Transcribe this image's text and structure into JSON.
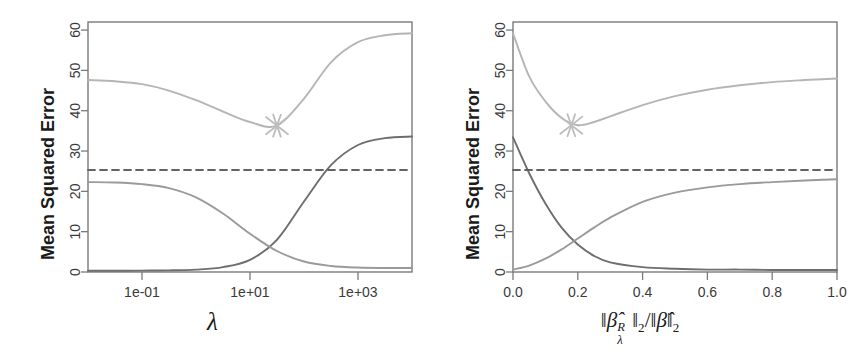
{
  "figure": {
    "title": "",
    "background_color": "#ffffff",
    "panel_count": 2
  },
  "panels": [
    {
      "id": "left",
      "ylabel": "Mean Squared Error",
      "xlabel": "λ",
      "xlabel_kind": "lambda",
      "x_ticks": [
        "1e-01",
        "1e+01",
        "1e+03"
      ],
      "y_ticks": [
        "0",
        "10",
        "20",
        "30",
        "40",
        "50",
        "60"
      ]
    },
    {
      "id": "right",
      "ylabel": "Mean Squared Error",
      "xlabel": "‖β̂ᴿλ‖₂/‖β̂‖₂",
      "xlabel_kind": "norm-ratio",
      "xlabel_parts": {
        "open1": "‖",
        "beta1": "β̂",
        "sup1": "R",
        "sub1": "λ",
        "close1": "‖",
        "sub_close1": "2",
        "slash": "/",
        "open2": "‖",
        "beta2": "β̂",
        "close2": "‖",
        "sub_close2": "2"
      },
      "x_ticks": [
        "0.0",
        "0.2",
        "0.4",
        "0.6",
        "0.8",
        "1.0"
      ],
      "y_ticks": [
        "0",
        "10",
        "20",
        "30",
        "40",
        "50",
        "60"
      ]
    }
  ],
  "colors": {
    "squared_bias": "#6e6e6e",
    "variance": "#9a9a9a",
    "test_mse": "#b5b5b5",
    "irreducible_error": "#636363",
    "marker": "#bdbdbd",
    "axis": "#7a7a7a",
    "text": "#1a1a1a"
  },
  "chart_data": [
    {
      "type": "line",
      "id": "left-panel",
      "title": "",
      "xlabel": "λ",
      "ylabel": "Mean Squared Error",
      "xscale": "log",
      "xlim": [
        0.01,
        10000
      ],
      "ylim": [
        0,
        62
      ],
      "grid": false,
      "legend": "none",
      "x_tick_values": [
        0.1,
        10,
        1000
      ],
      "x_tick_labels": [
        "1e-01",
        "1e+01",
        "1e+03"
      ],
      "y_tick_values": [
        0,
        10,
        20,
        30,
        40,
        50,
        60
      ],
      "y_tick_labels": [
        "0",
        "10",
        "20",
        "30",
        "40",
        "50",
        "60"
      ],
      "x": [
        0.01,
        0.0316,
        0.1,
        0.316,
        1,
        3.16,
        10,
        31.6,
        100,
        316,
        1000,
        3160,
        10000
      ],
      "series": [
        {
          "name": "Squared bias",
          "color": "#6e6e6e",
          "values": [
            0.3,
            0.3,
            0.35,
            0.4,
            0.6,
            1.2,
            3.0,
            8.0,
            17.5,
            26.5,
            31.5,
            33.2,
            33.6
          ]
        },
        {
          "name": "Variance",
          "color": "#9a9a9a",
          "values": [
            22.3,
            22.2,
            21.8,
            20.8,
            18.5,
            14.5,
            9.5,
            5.2,
            2.6,
            1.5,
            1.1,
            1.0,
            1.0
          ]
        },
        {
          "name": "Test MSE",
          "color": "#b5b5b5",
          "values": [
            47.6,
            47.3,
            46.6,
            45.0,
            42.6,
            39.8,
            37.2,
            36.3,
            43.0,
            52.0,
            57.0,
            58.7,
            59.2
          ]
        },
        {
          "name": "Irreducible error",
          "color": "#636363",
          "style": "dashed",
          "values": [
            25.3,
            25.3,
            25.3,
            25.3,
            25.3,
            25.3,
            25.3,
            25.3,
            25.3,
            25.3,
            25.3,
            25.3,
            25.3
          ]
        }
      ],
      "annotations": [
        {
          "kind": "marker-x",
          "label": "minimum test MSE",
          "x": 31.6,
          "y": 36.3,
          "color": "#bdbdbd"
        }
      ]
    },
    {
      "type": "line",
      "id": "right-panel",
      "title": "",
      "xlabel": "‖β̂ᴿλ‖₂/‖β̂‖₂",
      "ylabel": "Mean Squared Error",
      "xscale": "linear",
      "xlim": [
        0.0,
        1.0
      ],
      "ylim": [
        0,
        62
      ],
      "grid": false,
      "legend": "none",
      "x_tick_values": [
        0.0,
        0.2,
        0.4,
        0.6,
        0.8,
        1.0
      ],
      "x_tick_labels": [
        "0.0",
        "0.2",
        "0.4",
        "0.6",
        "0.8",
        "1.0"
      ],
      "y_tick_values": [
        0,
        10,
        20,
        30,
        40,
        50,
        60
      ],
      "y_tick_labels": [
        "0",
        "10",
        "20",
        "30",
        "40",
        "50",
        "60"
      ],
      "x": [
        0.0,
        0.05,
        0.1,
        0.15,
        0.2,
        0.25,
        0.3,
        0.4,
        0.5,
        0.6,
        0.7,
        0.8,
        0.9,
        1.0
      ],
      "series": [
        {
          "name": "Squared bias",
          "color": "#6e6e6e",
          "values": [
            33.4,
            24.5,
            17.0,
            11.0,
            6.8,
            4.0,
            2.4,
            1.2,
            0.8,
            0.6,
            0.6,
            0.5,
            0.5,
            0.5
          ]
        },
        {
          "name": "Variance",
          "color": "#9a9a9a",
          "values": [
            0.6,
            1.6,
            3.3,
            5.6,
            8.3,
            11.0,
            13.5,
            17.4,
            19.7,
            21.0,
            21.8,
            22.3,
            22.7,
            23.0
          ]
        },
        {
          "name": "Test MSE",
          "color": "#b5b5b5",
          "values": [
            59.2,
            48.5,
            42.3,
            38.2,
            36.4,
            37.2,
            38.6,
            41.4,
            43.6,
            45.2,
            46.3,
            47.1,
            47.6,
            48.0
          ]
        },
        {
          "name": "Irreducible error",
          "color": "#636363",
          "style": "dashed",
          "values": [
            25.3,
            25.3,
            25.3,
            25.3,
            25.3,
            25.3,
            25.3,
            25.3,
            25.3,
            25.3,
            25.3,
            25.3,
            25.3,
            25.3
          ]
        }
      ],
      "annotations": [
        {
          "kind": "marker-x",
          "label": "minimum test MSE",
          "x": 0.18,
          "y": 36.4,
          "color": "#bdbdbd"
        }
      ]
    }
  ]
}
